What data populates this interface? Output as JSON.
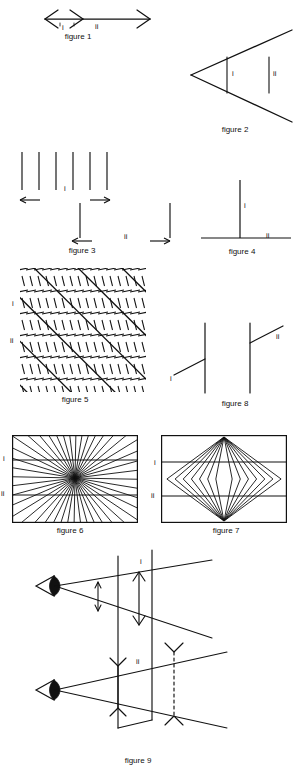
{
  "page": {
    "background_color": "#ffffff",
    "ink_color": "#111111",
    "width": 300,
    "height": 773
  },
  "figures": [
    {
      "id": "figure-1",
      "caption": "figure 1",
      "illusion": "Muller-Lyer",
      "labels": [
        {
          "text": "i",
          "x": 62,
          "y": 28
        },
        {
          "text": "ii",
          "x": 95,
          "y": 27
        }
      ],
      "caption_pos": {
        "x": 48,
        "y": 33,
        "w": 60
      }
    },
    {
      "id": "figure-2",
      "caption": "figure 2",
      "illusion": "Ponzo",
      "labels": [
        {
          "text": "i",
          "x": 232,
          "y": 73
        },
        {
          "text": "ii",
          "x": 273,
          "y": 73
        }
      ],
      "caption_pos": {
        "x": 205,
        "y": 126,
        "w": 60
      }
    },
    {
      "id": "figure-3",
      "caption": "figure 3",
      "illusion": "Oppel-Kundt filled space",
      "labels": [
        {
          "text": "i",
          "x": 64,
          "y": 188
        },
        {
          "text": "ii",
          "x": 124,
          "y": 233
        }
      ],
      "caption_pos": {
        "x": 52,
        "y": 248,
        "w": 60
      }
    },
    {
      "id": "figure-4",
      "caption": "figure 4",
      "illusion": "Vertical-horizontal",
      "labels": [
        {
          "text": "i",
          "x": 244,
          "y": 205
        },
        {
          "text": "ii",
          "x": 268,
          "y": 239
        }
      ],
      "caption_pos": {
        "x": 212,
        "y": 249,
        "w": 60
      }
    },
    {
      "id": "figure-5",
      "caption": "figure 5",
      "illusion": "Zollner",
      "labels": [
        {
          "text": "i",
          "x": 13,
          "y": 303
        },
        {
          "text": "ii",
          "x": 11,
          "y": 340
        }
      ],
      "caption_pos": {
        "x": 45,
        "y": 396,
        "w": 60
      }
    },
    {
      "id": "figure-6",
      "caption": "figure 6",
      "illusion": "Hering",
      "labels": [
        {
          "text": "i",
          "x": 4,
          "y": 457
        },
        {
          "text": "ii",
          "x": 2,
          "y": 490
        }
      ],
      "caption_pos": {
        "x": 40,
        "y": 527,
        "w": 60
      }
    },
    {
      "id": "figure-7",
      "caption": "figure 7",
      "illusion": "Wundt",
      "labels": [
        {
          "text": "i",
          "x": 155,
          "y": 462
        },
        {
          "text": "ii",
          "x": 152,
          "y": 494
        }
      ],
      "caption_pos": {
        "x": 196,
        "y": 527,
        "w": 60
      }
    },
    {
      "id": "figure-8",
      "caption": "figure 8",
      "illusion": "Poggendorff",
      "labels": [
        {
          "text": "i",
          "x": 170,
          "y": 379
        },
        {
          "text": "ii",
          "x": 275,
          "y": 337
        }
      ],
      "caption_pos": {
        "x": 205,
        "y": 400,
        "w": 60
      }
    },
    {
      "id": "figure-9",
      "caption": "figure 9",
      "illusion": "Visual angle / projection plane",
      "labels": [
        {
          "text": "i",
          "x": 140,
          "y": 561
        },
        {
          "text": "ii",
          "x": 137,
          "y": 661
        }
      ],
      "caption_pos": {
        "x": 108,
        "y": 756,
        "w": 60
      }
    }
  ],
  "figure5": {
    "hatch_groups": 12,
    "main_lines": 6
  },
  "figure6": {
    "ray_count": 44,
    "parallel_lines": 2
  },
  "figure7": {
    "fan_count": 7,
    "parallel_lines": 2
  },
  "figure3": {
    "group_i_lines": 6,
    "group_ii_lines": 2
  }
}
